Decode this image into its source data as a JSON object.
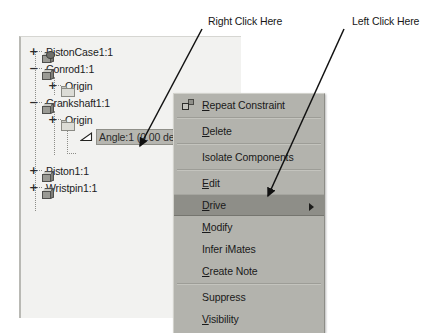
{
  "browser_tree": {
    "nodes": [
      {
        "label": "PistonCase1:1",
        "toggle": "+",
        "icon": "assembly-cube-icon",
        "indent": 0,
        "selected": false
      },
      {
        "label": "Conrod1:1",
        "toggle": "−",
        "icon": "part-cube-icon",
        "indent": 0,
        "selected": false
      },
      {
        "label": "Origin",
        "toggle": "+",
        "icon": "folder-icon",
        "indent": 1,
        "selected": false
      },
      {
        "label": "Crankshaft1:1",
        "toggle": "−",
        "icon": "part-cube-icon",
        "indent": 0,
        "selected": false
      },
      {
        "label": "Origin",
        "toggle": "+",
        "icon": "folder-icon",
        "indent": 1,
        "selected": false
      },
      {
        "label": "Angle:1 (0.00 deg)",
        "toggle": "",
        "icon": "angle-constraint-icon",
        "indent": 2,
        "selected": true
      },
      {
        "label": "Piston1:1",
        "toggle": "+",
        "icon": "part-cube-icon",
        "indent": 0,
        "selected": false
      },
      {
        "label": "Wristpin1:1",
        "toggle": "+",
        "icon": "part-cube-icon",
        "indent": 0,
        "selected": false
      }
    ]
  },
  "context_menu": {
    "items": [
      {
        "label": "Repeat Constraint",
        "mnemonic": "R",
        "icon": "repeat-constraint-icon",
        "highlight": false,
        "submenu": false,
        "separator_after": true
      },
      {
        "label": "Delete",
        "mnemonic": "D",
        "icon": "",
        "highlight": false,
        "submenu": false,
        "separator_after": true
      },
      {
        "label": "Isolate Components",
        "mnemonic": "",
        "icon": "",
        "highlight": false,
        "submenu": false,
        "separator_after": true
      },
      {
        "label": "Edit",
        "mnemonic": "E",
        "icon": "",
        "highlight": false,
        "submenu": false,
        "separator_after": false
      },
      {
        "label": "Drive",
        "mnemonic": "D",
        "icon": "",
        "highlight": true,
        "submenu": true,
        "separator_after": false
      },
      {
        "label": "Modify",
        "mnemonic": "M",
        "icon": "",
        "highlight": false,
        "submenu": false,
        "separator_after": false
      },
      {
        "label": "Infer iMates",
        "mnemonic": "",
        "icon": "",
        "highlight": false,
        "submenu": false,
        "separator_after": false
      },
      {
        "label": "Create Note",
        "mnemonic": "C",
        "icon": "",
        "highlight": false,
        "submenu": false,
        "separator_after": true
      },
      {
        "label": "Suppress",
        "mnemonic": "",
        "icon": "",
        "highlight": false,
        "submenu": false,
        "separator_after": false
      },
      {
        "label": "Visibility",
        "mnemonic": "V",
        "icon": "",
        "highlight": false,
        "submenu": false,
        "separator_after": false
      }
    ]
  },
  "annotations": [
    {
      "text": "Right Click Here",
      "target": "angle-constraint-row"
    },
    {
      "text": "Left Click Here",
      "target": "drive-menu-item"
    }
  ],
  "colors": {
    "panel_background": "#f2f2f0",
    "menu_background": "#b3b3ad",
    "menu_highlight": "#8e8e88",
    "selection": "#b6b6b0",
    "text": "#1a1a1a"
  }
}
